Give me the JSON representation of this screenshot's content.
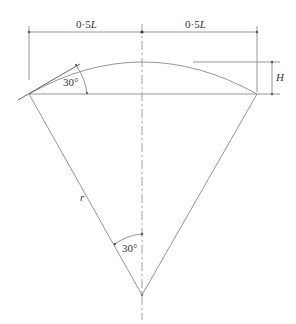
{
  "diagram": {
    "labels": {
      "half_span_left": "0·5",
      "half_span_left_var": "L",
      "half_span_right": "0·5",
      "half_span_right_var": "L",
      "rise": "H",
      "tangent_angle": "30°",
      "radius": "r",
      "central_half_angle": "30°"
    },
    "colors": {
      "line": "#8a8a8a",
      "text": "#333333",
      "background": "#ffffff"
    }
  }
}
